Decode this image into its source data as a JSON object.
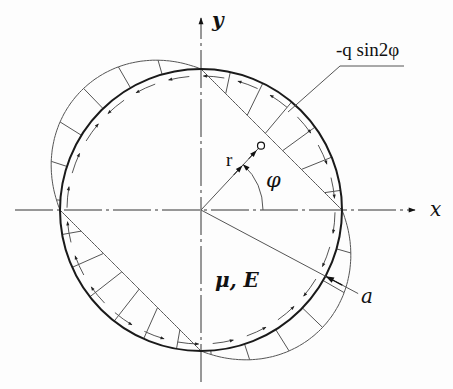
{
  "figure": {
    "width": 453,
    "height": 389,
    "center": [
      201,
      210
    ],
    "radius": 141,
    "colors": {
      "circle": "#1a1a1a",
      "thin": "#555555",
      "axis": "#333333",
      "text": "#111111"
    }
  },
  "labels": {
    "y_axis": "y",
    "x_axis": "x",
    "radius_var": "r",
    "angle": "φ",
    "material": "μ, E",
    "radius_const": "a",
    "load": "-q sin2φ"
  },
  "elements": {
    "load_distribution": "normal load -q·sin2φ drawn around boundary; outward in quadrants II and IV, inward in I and III",
    "tangential_arrows": "shear traction arrows along inner boundary",
    "point_marker": "small circle at polar point (r, φ)"
  }
}
